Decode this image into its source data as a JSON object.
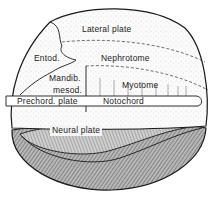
{
  "figure": {
    "type": "embryo-fate-map",
    "labels": {
      "lateral_plate": "Lateral plate",
      "entod": "Entod.",
      "nephrotome": "Nephrotome",
      "mandib_mesod_line1": "Mandib.",
      "mandib_mesod_line2": "mesod.",
      "myotome": "Myotome",
      "prechord_plate": "Prechord. plate",
      "notochord": "Notochord",
      "neural_plate": "Neural plate"
    },
    "colors": {
      "line": "#1a1a1a",
      "stipple_fill": "#f3f3f3",
      "shaded_fill": "#9a9a9a",
      "background": "#ffffff"
    }
  }
}
